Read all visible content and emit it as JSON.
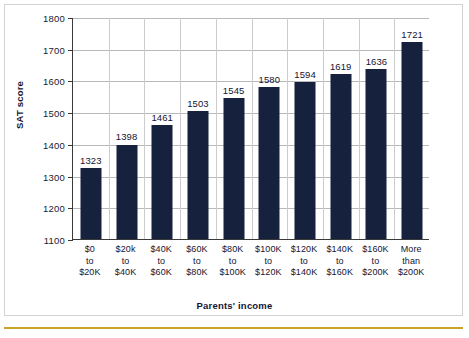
{
  "chart_data": {
    "type": "bar",
    "title": "",
    "xlabel": "Parents' income",
    "ylabel": "SAT score",
    "ylim": [
      1100,
      1800
    ],
    "ytick_step": 100,
    "yticks": [
      "1100",
      "1200",
      "1300",
      "1400",
      "1500",
      "1600",
      "1700",
      "1800"
    ],
    "grid": "horizontal-and-vertical",
    "legend": "none",
    "bar_color": "#16213e",
    "categories": [
      "$0\nto\n$20K",
      "$20k\nto\n$40K",
      "$40K\nto\n$60K",
      "$60K\nto\n$80K",
      "$80K\nto\n$100K",
      "$100K\nto\n$120K",
      "$120K\nto\n$140K",
      "$140K\nto\n$160K",
      "$160K\nto\n$200K",
      "More\nthan\n$200K"
    ],
    "values": [
      1323,
      1398,
      1461,
      1503,
      1545,
      1580,
      1594,
      1619,
      1636,
      1721
    ],
    "data_labels": [
      "1323",
      "1398",
      "1461",
      "1503",
      "1545",
      "1580",
      "1594",
      "1619",
      "1636",
      "1721"
    ]
  },
  "accent": {
    "rule_color": "#c9a227",
    "frame_color": "#d2d2d2"
  }
}
